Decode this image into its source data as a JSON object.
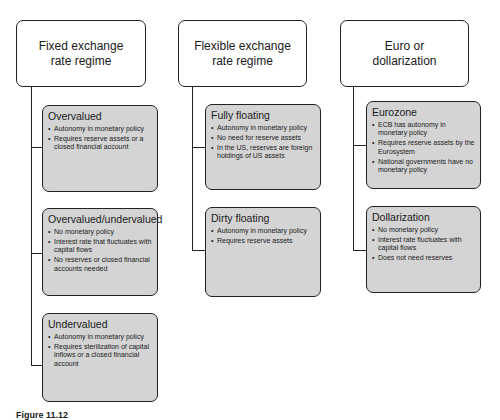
{
  "columns": [
    {
      "title_lines": [
        "Fixed exchange",
        "rate regime"
      ],
      "children": [
        {
          "title": "Overvalued",
          "bullets": [
            "Autonomy in monetary policy",
            "Requires reserve assets or a closed financial account"
          ]
        },
        {
          "title": "Overvalued/undervalued",
          "bullets": [
            "No monetary policy",
            "Interest rate that fluctuates with capital flows",
            "No reserves or closed financial accounts needed"
          ]
        },
        {
          "title": "Undervalued",
          "bullets": [
            "Autonomy in monetary policy",
            "Requires sterilization of capital inflows or a closed financial account"
          ]
        }
      ]
    },
    {
      "title_lines": [
        "Flexible exchange",
        "rate regime"
      ],
      "children": [
        {
          "title": "Fully floating",
          "bullets": [
            "Autonomy in monetary policy",
            "No need for reserve assets",
            "In the US, reserves are foreign holdings of US assets"
          ]
        },
        {
          "title": "Dirty floating",
          "bullets": [
            "Autonomy in monetary policy",
            "Requires reserve assets"
          ]
        }
      ]
    },
    {
      "title_lines": [
        "Euro or",
        "dollarization"
      ],
      "children": [
        {
          "title": "Eurozone",
          "bullets": [
            "ECB has autonomy in monetary policy",
            "Requires reserve assets by the Eurosystem",
            "National governments have no monetary policy"
          ]
        },
        {
          "title": "Dollarization",
          "bullets": [
            "No monetary policy",
            "Interest rate fluctuates with capital flows",
            "Does not need reserves"
          ]
        }
      ]
    }
  ],
  "caption": "Figure 11.12",
  "colors": {
    "child_fill": "#d4d4d4",
    "border": "#222222",
    "background": "#ffffff"
  }
}
